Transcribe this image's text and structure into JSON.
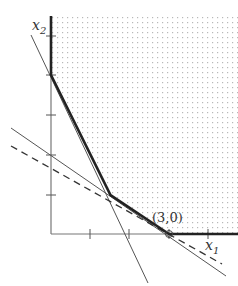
{
  "diagram": {
    "type": "linear-program-feasible-region",
    "axes": {
      "x_label": "x",
      "x_sub": "1",
      "y_label": "x",
      "y_sub": "2",
      "x_ticks": [
        1,
        2,
        3,
        4
      ],
      "y_ticks": [
        1,
        2,
        3,
        4,
        5
      ]
    },
    "annotation": "(3,0)",
    "feasible_region_vertices": [
      [
        0,
        4
      ],
      [
        1.5,
        1
      ],
      [
        3,
        0
      ]
    ],
    "constraint_lines": [
      {
        "name": "steep-constraint",
        "equation": "2x1 + x2 = 4",
        "style": "thin"
      },
      {
        "name": "shallow-constraint",
        "equation": "2x1 + 3x2 = 6",
        "style": "thin"
      },
      {
        "name": "objective-level-line",
        "style": "dashed"
      }
    ],
    "optimal_point": [
      3,
      0
    ],
    "colors": {
      "boundary": "#222222",
      "thin_line": "#555555",
      "dots": "#b8b8b8",
      "axis": "#666666"
    }
  }
}
